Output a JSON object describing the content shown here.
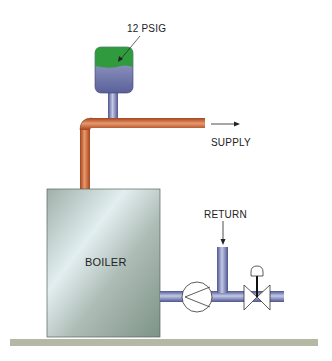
{
  "diagram": {
    "type": "steam boiler system schematic",
    "labels": {
      "gauge": "12 PSIG",
      "supply": "SUPPLY",
      "return": "RETURN",
      "boiler": "BOILER"
    },
    "components": [
      {
        "id": "pressure-gauge",
        "label": "12 PSIG"
      },
      {
        "id": "supply-pipe",
        "label": "SUPPLY"
      },
      {
        "id": "boiler",
        "label": "BOILER"
      },
      {
        "id": "return-pipe",
        "label": "RETURN"
      },
      {
        "id": "pump"
      },
      {
        "id": "control-valve"
      }
    ],
    "colors": {
      "supply_pipe": "#c8623a",
      "return_pipe": "#7a82b8",
      "gauge_top": "#2f9a3e",
      "gauge_bottom": "#7a80b4",
      "boiler": "#a9b8b0",
      "ground": "#b4b8a4"
    }
  }
}
